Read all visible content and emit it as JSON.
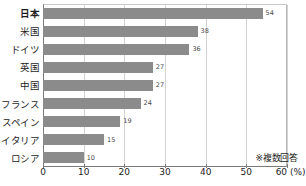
{
  "chart_data": {
    "type": "bar",
    "orientation": "horizontal",
    "title": "",
    "xlabel": "(%)",
    "ylabel": "",
    "xlim": [
      0,
      60
    ],
    "xticks": [
      0,
      10,
      20,
      30,
      40,
      50,
      60
    ],
    "xtick_labels": [
      "0",
      "10",
      "20",
      "30",
      "40",
      "50",
      "60 (%)"
    ],
    "grid": true,
    "grid_axis": "x",
    "legend": false,
    "categories": [
      "日本",
      "米国",
      "ドイツ",
      "英国",
      "中国",
      "フランス",
      "スペイン",
      "イタリア",
      "ロシア"
    ],
    "values": [
      54,
      38,
      36,
      27,
      27,
      24,
      19,
      15,
      10
    ],
    "value_labels": [
      "54",
      "38",
      "36",
      "27",
      "27",
      "24",
      "19",
      "15",
      "10"
    ],
    "emphasis_category": "日本",
    "annotation": "※複数回答",
    "bar_color": "#8b8b8b",
    "axis_color": "#7a7a7a",
    "grid_color": "#d2d2d2",
    "text_color": "#1c1c1c"
  }
}
